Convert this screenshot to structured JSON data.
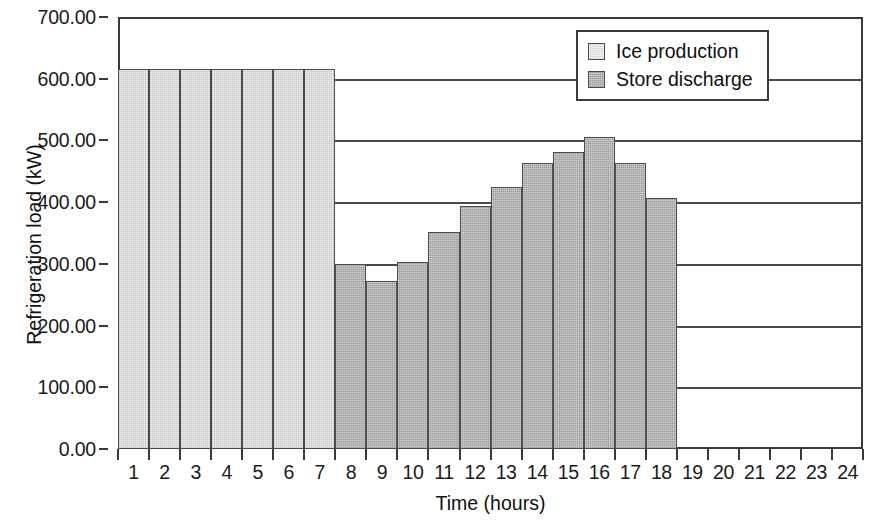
{
  "chart_data": {
    "type": "bar",
    "title": "",
    "xlabel": "Time (hours)",
    "ylabel": "Refrigeration load (kW)",
    "ylim": [
      0,
      700
    ],
    "ytick_labels": [
      "700.00",
      "600.00",
      "500.00",
      "400.00",
      "300.00",
      "200.00",
      "100.00",
      "0.00"
    ],
    "ytick_values": [
      700,
      600,
      500,
      400,
      300,
      200,
      100,
      0
    ],
    "grid": true,
    "legend_position": "top-right",
    "categories": [
      "1",
      "2",
      "3",
      "4",
      "5",
      "6",
      "7",
      "8",
      "9",
      "10",
      "11",
      "12",
      "13",
      "14",
      "15",
      "16",
      "17",
      "18",
      "19",
      "20",
      "21",
      "22",
      "23",
      "24"
    ],
    "series": [
      {
        "name": "Ice production",
        "color": "#ededed",
        "values": [
          615,
          615,
          615,
          615,
          615,
          615,
          615,
          0,
          0,
          0,
          0,
          0,
          0,
          0,
          0,
          0,
          0,
          0,
          0,
          0,
          0,
          0,
          0,
          0
        ]
      },
      {
        "name": "Store discharge",
        "color": "#b9b9b9",
        "values": [
          0,
          0,
          0,
          0,
          0,
          0,
          0,
          300,
          273,
          303,
          352,
          394,
          424,
          464,
          481,
          506,
          464,
          407,
          0,
          0,
          0,
          0,
          0,
          0
        ]
      }
    ]
  },
  "legend": {
    "items": [
      {
        "label": "Ice production",
        "swatch": "ice"
      },
      {
        "label": "Store discharge",
        "swatch": "store"
      }
    ]
  }
}
